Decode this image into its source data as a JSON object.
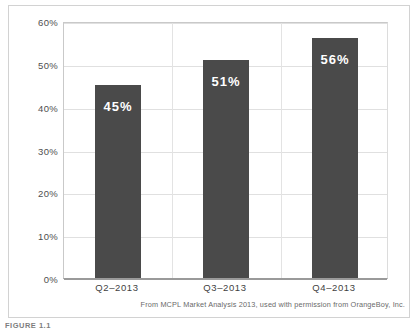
{
  "figure": {
    "label": "FIGURE 1.1",
    "caption": "From MCPL Market Analysis 2013, used with permission from OrangeBoy, Inc."
  },
  "colors": {
    "bar": "#4a4a4a",
    "grid": "#e0e0e0",
    "axis": "#9a9a9a",
    "frame": "#d2d2d2",
    "value_label": "#ffffff",
    "background": "#ffffff"
  },
  "chart_data": {
    "type": "bar",
    "title": "",
    "subtitle": "",
    "xlabel": "",
    "ylabel": "",
    "categories": [
      "Q2–2013",
      "Q3–2013",
      "Q4–2013"
    ],
    "values": [
      45,
      51,
      56
    ],
    "data_labels": [
      "45%",
      "51%",
      "56%"
    ],
    "ylim": [
      0,
      60
    ],
    "yticks": [
      0,
      10,
      20,
      30,
      40,
      50,
      60
    ],
    "ytick_labels": [
      "0%",
      "10%",
      "20%",
      "30%",
      "40%",
      "50%",
      "60%"
    ],
    "grid": true,
    "legend": false,
    "legend_position": "none"
  }
}
